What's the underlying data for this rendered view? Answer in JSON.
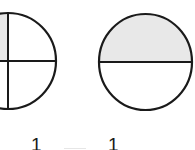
{
  "diagram": {
    "title": "",
    "figures": [
      {
        "id": "quarters-circle",
        "shape": "circle",
        "parts": 4,
        "shaded_parts": 1,
        "shaded_region": "top-left quadrant",
        "numerator_label": "1"
      },
      {
        "id": "halves-circle",
        "shape": "circle",
        "parts": 2,
        "shaded_parts": 1,
        "shaded_region": "top half",
        "numerator_label": "1"
      }
    ],
    "colors": {
      "stroke": "#1a1a1a",
      "shade": "#e8e8e8",
      "background": "#ffffff"
    }
  }
}
